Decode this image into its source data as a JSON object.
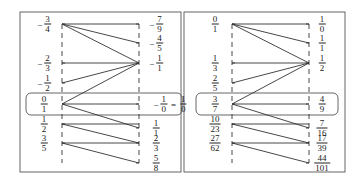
{
  "panels": [
    {
      "name": "left",
      "left_labels": [
        {
          "sign": "-",
          "num": "3",
          "den": "4"
        },
        {
          "sign": "-",
          "num": "2",
          "den": "3"
        },
        {
          "sign": "-",
          "num": "1",
          "den": "2"
        },
        {
          "sign": "",
          "num": "0",
          "den": "1"
        },
        {
          "sign": "",
          "num": "1",
          "den": "2"
        },
        {
          "sign": "",
          "num": "3",
          "den": "5"
        }
      ],
      "right_labels": [
        {
          "sign": "-",
          "num": "7",
          "den": "9"
        },
        {
          "sign": "-",
          "num": "4",
          "den": "5"
        },
        {
          "sign": "-",
          "num": "1",
          "den": "1"
        },
        {
          "sign": "-",
          "num": "1",
          "den": "0",
          "equals": "=",
          "alt_num": "1",
          "alt_den": "0"
        },
        {
          "sign": "",
          "num": "1",
          "den": "1"
        },
        {
          "sign": "",
          "num": "2",
          "den": "3"
        },
        {
          "sign": "",
          "num": "5",
          "den": "8"
        }
      ]
    },
    {
      "name": "right",
      "left_labels": [
        {
          "sign": "",
          "num": "0",
          "den": "1"
        },
        {
          "sign": "",
          "num": "1",
          "den": "3"
        },
        {
          "sign": "",
          "num": "2",
          "den": "5"
        },
        {
          "sign": "",
          "num": "3",
          "den": "7"
        },
        {
          "sign": "",
          "num": "10",
          "den": "23"
        },
        {
          "sign": "",
          "num": "27",
          "den": "62"
        }
      ],
      "right_labels": [
        {
          "sign": "",
          "num": "1",
          "den": "0"
        },
        {
          "sign": "",
          "num": "1",
          "den": "1"
        },
        {
          "sign": "",
          "num": "1",
          "den": "2"
        },
        {
          "sign": "",
          "num": "4",
          "den": "9"
        },
        {
          "sign": "",
          "num": "7",
          "den": "16"
        },
        {
          "sign": "",
          "num": "17",
          "den": "39"
        },
        {
          "sign": "",
          "num": "44",
          "den": "101"
        }
      ]
    }
  ],
  "colors": {
    "line": "#333333",
    "frame": "#555555"
  }
}
